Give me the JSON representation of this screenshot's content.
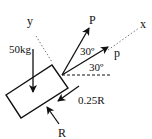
{
  "diagram": {
    "type": "free-body-diagram",
    "axes": {
      "x_label": "x",
      "y_label": "y"
    },
    "block": {
      "mass_label": "50kg"
    },
    "forces": {
      "P_upper": "P",
      "p_lower": "p",
      "friction": "0.25R",
      "normal": "R"
    },
    "angles": {
      "upper": "30º",
      "lower": "30º"
    },
    "colors": {
      "stroke": "#111111",
      "background": "#ffffff"
    }
  }
}
